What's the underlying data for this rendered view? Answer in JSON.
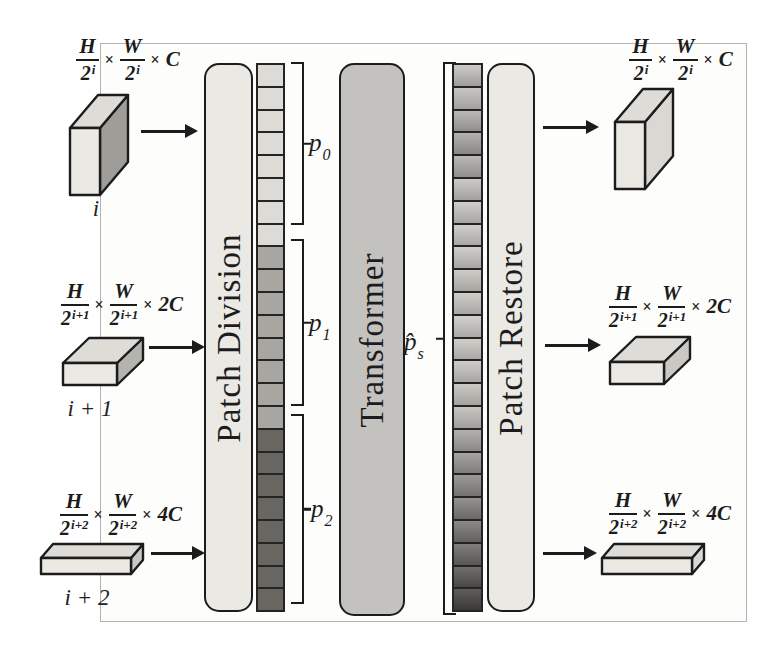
{
  "bars": {
    "patch_division": "Patch Division",
    "transformer": "Transformer",
    "patch_restore": "Patch Restore"
  },
  "levels": [
    {
      "h": "H",
      "w": "W",
      "den_base": "2",
      "exp": "i",
      "times": "×",
      "channels": "C",
      "box_label": "i"
    },
    {
      "h": "H",
      "w": "W",
      "den_base": "2",
      "exp": "i+1",
      "times": "×",
      "channels": "2C",
      "box_label": "i + 1"
    },
    {
      "h": "H",
      "w": "W",
      "den_base": "2",
      "exp": "i+2",
      "times": "×",
      "channels": "4C",
      "box_label": "i + 2"
    }
  ],
  "patch_groups": [
    {
      "label_base": "p",
      "label_sub": "0",
      "cell_count": 8,
      "cell_color": "#dcdbd6"
    },
    {
      "label_base": "p",
      "label_sub": "1",
      "cell_count": 8,
      "cell_color": "#a7a6a1"
    },
    {
      "label_base": "p",
      "label_sub": "2",
      "cell_count": 8,
      "cell_color": "#686661"
    }
  ],
  "restored_tokens": {
    "label_base": "p̂",
    "label_sub": "s",
    "cells": [
      [
        "#cdccc8",
        "#9e9d99"
      ],
      [
        "#c6c5c1",
        "#a3a29e"
      ],
      [
        "#bbbab6",
        "#8f8e8a"
      ],
      [
        "#b3b2ae",
        "#898884"
      ],
      [
        "#bab9b5",
        "#908f8b"
      ],
      [
        "#cbcac6",
        "#a2a19d"
      ],
      [
        "#cfcec9",
        "#a6a5a1"
      ],
      [
        "#d0cfcb",
        "#a9a8a4"
      ],
      [
        "#cfcec9",
        "#a8a7a3"
      ],
      [
        "#cdccc7",
        "#a5a4a0"
      ],
      [
        "#cfcec9",
        "#a8a7a3"
      ],
      [
        "#d1d0cc",
        "#abaaa6"
      ],
      [
        "#d0cfca",
        "#a9a8a4"
      ],
      [
        "#cecdc8",
        "#a7a6a2"
      ],
      [
        "#cbcac5",
        "#a4a39f"
      ],
      [
        "#c7c6c1",
        "#a09f9b"
      ],
      [
        "#b2b1ad",
        "#8a8985"
      ],
      [
        "#a6a5a1",
        "#7e7d79"
      ],
      [
        "#9b9a96",
        "#737270"
      ],
      [
        "#93928e",
        "#6b6a66"
      ],
      [
        "#8a8985",
        "#626160"
      ],
      [
        "#7f7e7a",
        "#585755"
      ],
      [
        "#716f6c",
        "#4a4947"
      ],
      [
        "#5f5e5b",
        "#3a3938"
      ]
    ]
  },
  "palette": {
    "ink": "#1c1c1c",
    "frame_border": "#b5b3b0",
    "canvas_bg": "#ffffff",
    "figure_bg": "#fdfdfc",
    "light_bar_fill": "#eae9e4",
    "transformer_fill": "#c3c2be",
    "cell_border": "#242424",
    "box_front": "#ebe9e4",
    "box_top": "#dedcd7",
    "box_side_dark": "#9e9d97",
    "box_side_medium": "#b4b3ae",
    "box_side_soft": "#c9c8c3",
    "box_side_light": "#d9d8d3"
  }
}
